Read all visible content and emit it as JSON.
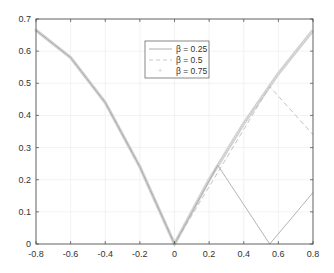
{
  "chart_data": {
    "type": "line",
    "title": "",
    "xlabel": "",
    "ylabel": "",
    "xlim": [
      -0.8,
      0.8
    ],
    "ylim": [
      0,
      0.7
    ],
    "grid": true,
    "legend_position": "upper center",
    "x_ticks": [
      "-0.8",
      "-0.6",
      "-0.4",
      "-0.2",
      "0",
      "0.2",
      "0.4",
      "0.6",
      "0.8"
    ],
    "y_ticks": [
      "0",
      "0.1",
      "0.2",
      "0.3",
      "0.4",
      "0.5",
      "0.6",
      "0.7"
    ],
    "series": [
      {
        "name": "β = 0.25",
        "style": "solid",
        "color": "#aaaaaa",
        "x": [
          -0.8,
          -0.6,
          -0.4,
          -0.2,
          0,
          0.25,
          0.55,
          0.8
        ],
        "y": [
          0.665,
          0.58,
          0.44,
          0.24,
          0,
          0.245,
          0,
          0.16
        ]
      },
      {
        "name": "β = 0.5",
        "style": "dashed",
        "color": "#bbbbbb",
        "x": [
          -0.8,
          -0.6,
          -0.4,
          -0.2,
          0,
          0.55,
          0.8
        ],
        "y": [
          0.665,
          0.58,
          0.44,
          0.24,
          0,
          0.49,
          0.34
        ]
      },
      {
        "name": "β = 0.75",
        "style": "markers",
        "color": "#cccccc",
        "x": [
          -0.8,
          -0.6,
          -0.4,
          -0.2,
          0,
          0.2,
          0.4,
          0.6,
          0.8
        ],
        "y": [
          0.665,
          0.58,
          0.44,
          0.24,
          0,
          0.2,
          0.375,
          0.53,
          0.665
        ]
      }
    ]
  },
  "legend": {
    "items": [
      "β = 0.25",
      "β = 0.5",
      "β = 0.75"
    ]
  }
}
